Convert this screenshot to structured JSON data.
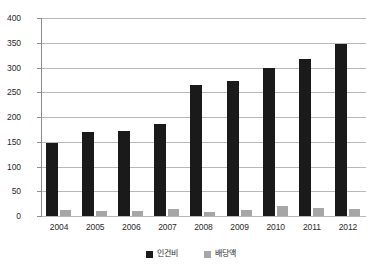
{
  "chart_data": {
    "type": "bar",
    "title": "",
    "xlabel": "",
    "ylabel": "",
    "categories": [
      "2004",
      "2005",
      "2006",
      "2007",
      "2008",
      "2009",
      "2010",
      "2011",
      "2012"
    ],
    "series": [
      {
        "name": "인건비",
        "color": "#1a1a1a",
        "values": [
          148,
          170,
          172,
          186,
          265,
          272,
          299,
          318,
          348
        ]
      },
      {
        "name": "배당액",
        "color": "#a6a6a6",
        "values": [
          13,
          11,
          11,
          15,
          8,
          13,
          20,
          17,
          14
        ]
      }
    ],
    "ylim": [
      0,
      400
    ],
    "ytick_step": 50,
    "yticks": [
      "0",
      "50",
      "100",
      "150",
      "200",
      "250",
      "300",
      "350",
      "400"
    ],
    "grid": true,
    "grid_axis": "y",
    "legend_position": "bottom"
  },
  "legend": {
    "items": [
      {
        "label": "인건비",
        "color": "#1a1a1a"
      },
      {
        "label": "배당액",
        "color": "#a6a6a6"
      }
    ]
  }
}
